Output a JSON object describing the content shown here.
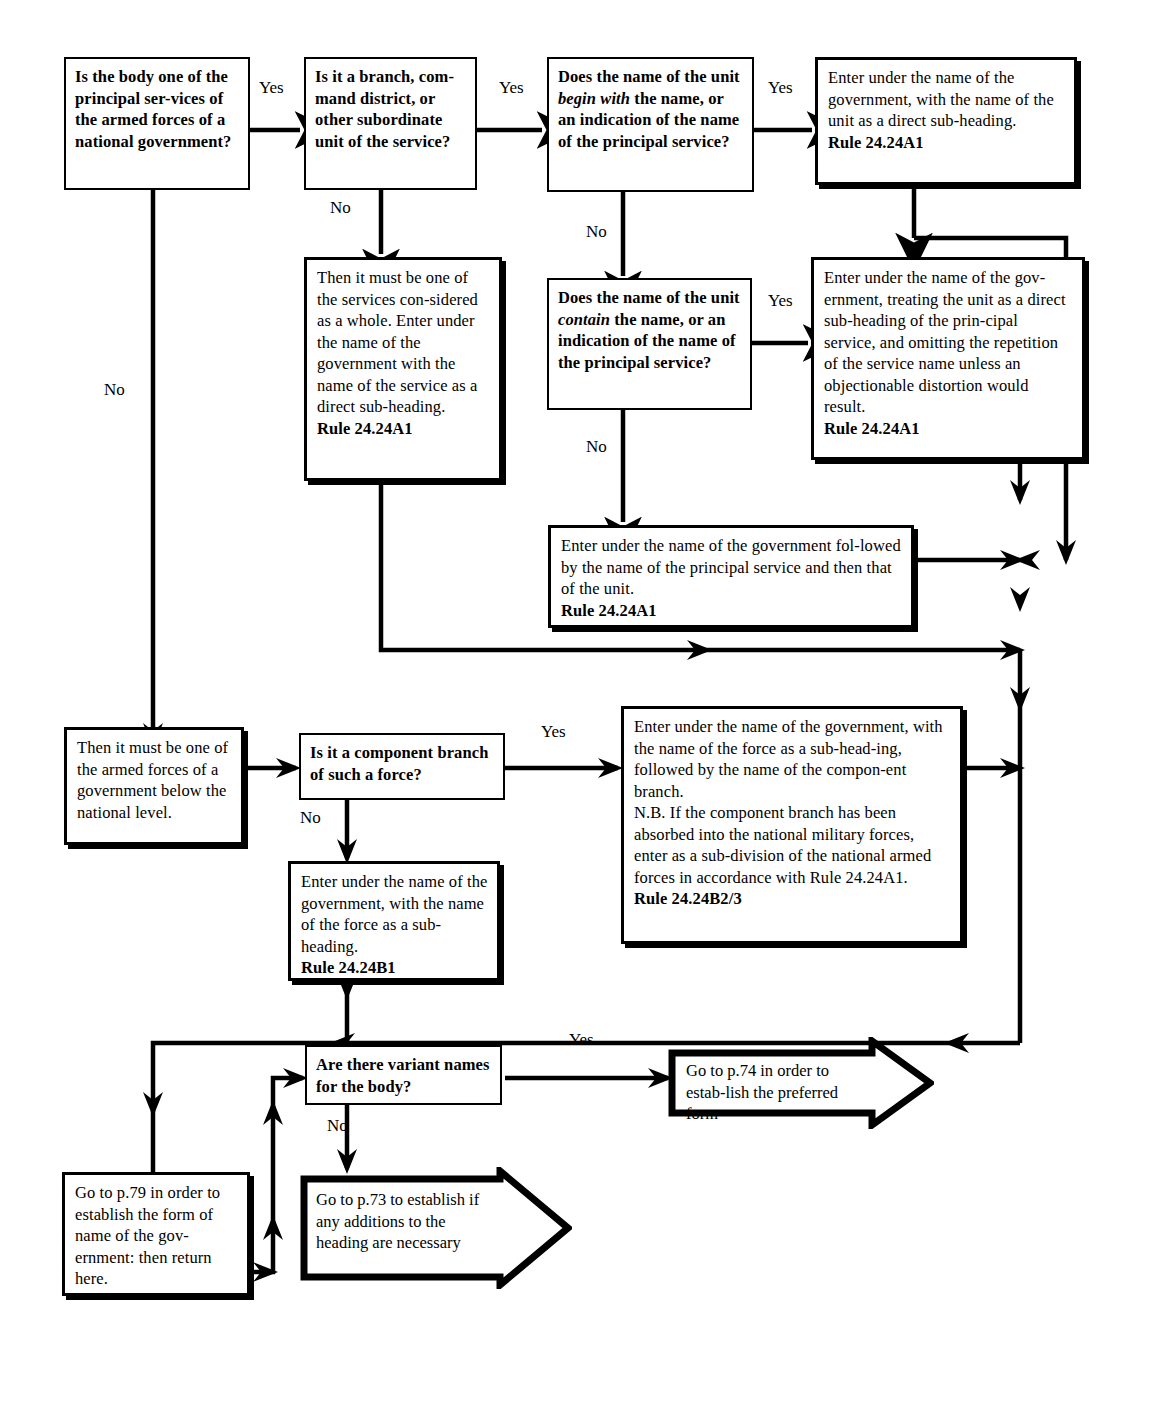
{
  "diagram": {
    "ink_color": "#000000",
    "paper_color": "#ffffff"
  },
  "nodes": {
    "q1": {
      "kind": "question",
      "text": "Is the body one of the principal ser-vices of the armed forces of a national government?",
      "lines": [
        "Is the body one of",
        "the principal ser-",
        "vices of the armed",
        "forces of a national",
        "government?"
      ]
    },
    "q2": {
      "kind": "question",
      "lines": [
        "Is it a branch, com-",
        "mand district, or",
        "other subordinate",
        "unit of the service?"
      ]
    },
    "q3": {
      "kind": "question",
      "lines": [
        "Does the name of the",
        "unit begin with the",
        "name, or an indication",
        "of the name of the",
        "principal service?"
      ],
      "italic_phrase": "begin with"
    },
    "a1": {
      "kind": "action",
      "lines": [
        "Enter under the name of the",
        "government, with the name",
        "of the unit as a direct sub-",
        "heading."
      ],
      "rule": "Rule 24.24A1"
    },
    "a2": {
      "kind": "action",
      "lines": [
        "Then it must be one",
        "of the services con-",
        "sidered as a whole.",
        "Enter under the name",
        "of the government",
        "with the name of the",
        "service as a direct",
        "sub-heading."
      ],
      "rule": "Rule 24.24A1"
    },
    "q4": {
      "kind": "question",
      "lines": [
        "Does the name of the",
        "unit contain the name,",
        "or an indication of the",
        "name of the principal",
        "service?"
      ],
      "italic_phrase": "contain"
    },
    "a3": {
      "kind": "action",
      "lines": [
        "Enter under the name of the gov-",
        "ernment, treating the unit as a",
        "direct sub-heading of the prin-",
        "cipal service, and omitting the",
        "repetition of the service name",
        "unless an objectionable distortion",
        "would result."
      ],
      "rule": "Rule 24.24A1"
    },
    "a4": {
      "kind": "action",
      "lines": [
        "Enter under the name of the government fol-",
        "lowed by the name of the principal service",
        "and then that of the unit."
      ],
      "rule": "Rule 24.24A1"
    },
    "a5": {
      "kind": "action",
      "lines": [
        "Then it must be one",
        "of the armed forces",
        "of a government",
        "below the national",
        "level."
      ],
      "rule": ""
    },
    "q5": {
      "kind": "question",
      "lines": [
        "Is it a component",
        "branch of such a force?"
      ]
    },
    "a6": {
      "kind": "action",
      "lines": [
        "Enter under the name of the government,",
        "with the name of the force as a sub-head-",
        "ing, followed by the name of the compon-",
        "ent branch.",
        "N.B. If the component branch has been",
        "absorbed into the national military forces,",
        "enter as a sub-division of the national",
        "armed forces in accordance with Rule",
        "24.24A1."
      ],
      "rule": "Rule 24.24B2/3"
    },
    "a7": {
      "kind": "action",
      "lines": [
        "Enter under the name of",
        "the government, with the",
        "name of the force as a",
        "sub-heading."
      ],
      "rule": "Rule 24.24B1"
    },
    "q6": {
      "kind": "question",
      "lines": [
        "Are there variant",
        "names for the body?"
      ]
    },
    "t74": {
      "kind": "terminal-arrow",
      "lines": [
        "Go to p.74 in order to estab-",
        "lish the preferred form"
      ]
    },
    "t73": {
      "kind": "terminal-arrow",
      "lines": [
        "Go to p.73 to establish if any",
        "additions to the heading are",
        "necessary"
      ]
    },
    "a8": {
      "kind": "action",
      "lines": [
        "Go to p.79 in order",
        "to establish the form",
        "of name of the gov-",
        "ernment: then return",
        "here."
      ],
      "rule": ""
    }
  },
  "edge_labels": {
    "yes_1": "Yes",
    "yes_2": "Yes",
    "yes_3": "Yes",
    "yes_4": "Yes",
    "yes_5": "Yes",
    "yes_6": "Yes",
    "no_1": "No",
    "no_2": "No",
    "no_3": "No",
    "no_4": "No",
    "no_5": "No",
    "no_6": "No"
  }
}
